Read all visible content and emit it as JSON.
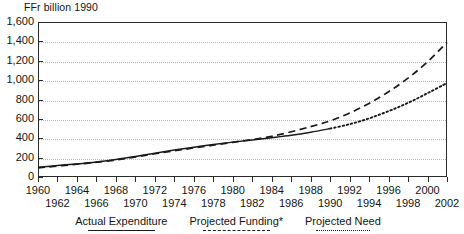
{
  "chart_data": {
    "type": "line",
    "title": "",
    "ylabel": "FFr billion 1990",
    "xlabel": "",
    "ylim": [
      0,
      1600
    ],
    "xlim": [
      1960,
      2002
    ],
    "grid": true,
    "legend_position": "bottom",
    "y_ticks": [
      0,
      200,
      400,
      600,
      800,
      1000,
      1200,
      1400,
      1600
    ],
    "y_tick_labels": [
      "0",
      "200",
      "400",
      "600",
      "800",
      "1,000",
      "1,200",
      "1,400",
      "1,600"
    ],
    "x_ticks": [
      1960,
      1962,
      1964,
      1966,
      1968,
      1970,
      1972,
      1974,
      1976,
      1978,
      1980,
      1982,
      1984,
      1986,
      1988,
      1990,
      1992,
      1994,
      1996,
      1998,
      2000,
      2002
    ],
    "x_tick_labels_upper": [
      "1960",
      "1964",
      "1968",
      "1972",
      "1976",
      "1980",
      "1984",
      "1988",
      "1992",
      "1996",
      "2000"
    ],
    "x_tick_labels_lower": [
      "1962",
      "1966",
      "1970",
      "1974",
      "1978",
      "1982",
      "1986",
      "1990",
      "1994",
      "1998",
      "2002"
    ],
    "series": [
      {
        "name": "Actual Expenditure",
        "style": "solid",
        "x": [
          1960,
          1962,
          1964,
          1966,
          1968,
          1970,
          1972,
          1974,
          1976,
          1978,
          1980,
          1982,
          1984,
          1986,
          1988,
          1990
        ],
        "values": [
          100,
          118,
          135,
          155,
          180,
          212,
          245,
          278,
          308,
          335,
          360,
          382,
          405,
          430,
          462,
          500
        ]
      },
      {
        "name": "Projected Funding*",
        "style": "dashed",
        "x": [
          1960,
          1964,
          1968,
          1972,
          1976,
          1980,
          1984,
          1988,
          1990,
          1992,
          1994,
          1996,
          1998,
          2000,
          2002
        ],
        "values": [
          95,
          132,
          175,
          240,
          300,
          358,
          420,
          520,
          580,
          660,
          760,
          880,
          1020,
          1190,
          1390
        ]
      },
      {
        "name": "Projected Need",
        "style": "dotted",
        "x": [
          1990,
          1992,
          1994,
          1996,
          1998,
          2000,
          2002
        ],
        "values": [
          500,
          545,
          605,
          680,
          765,
          865,
          970
        ]
      }
    ]
  },
  "legend": {
    "entries": [
      {
        "label": "Actual Expenditure",
        "style": "solid"
      },
      {
        "label": "Projected Funding*",
        "style": "dashed"
      },
      {
        "label": "Projected Need",
        "style": "dotted"
      }
    ]
  }
}
